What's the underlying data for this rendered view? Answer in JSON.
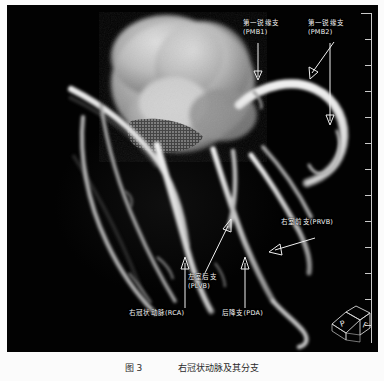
{
  "figure": {
    "modality": "CT coronary volume rendering",
    "caption": "图 3　　　　右冠状动脉及其分支",
    "background_color": "#020202",
    "page_color": "#fbfbfb",
    "annotation_color": "#f4f4f4"
  },
  "annotations": [
    {
      "id": "pmb1",
      "line1": "第一锐缘支",
      "line2": "(PMB1)",
      "x": 243,
      "y": 19,
      "arrow": {
        "x1": 258,
        "y1": 38,
        "x2": 258,
        "y2": 73,
        "head": "down"
      }
    },
    {
      "id": "pmb2",
      "line1": "第一锐缘支",
      "line2": "(PMB2)",
      "x": 308,
      "y": 19,
      "arrow": {
        "x1": 322,
        "y1": 38,
        "x2": 305,
        "y2": 72,
        "head": "down-left"
      }
    },
    {
      "id": "pmb2-long",
      "line1": "",
      "line2": "",
      "x": 0,
      "y": 0,
      "arrow": {
        "x1": 330,
        "y1": 40,
        "x2": 324,
        "y2": 120,
        "head": "down"
      }
    },
    {
      "id": "prvb",
      "line1": "右室前支(PRVB)",
      "line2": "",
      "x": 281,
      "y": 218,
      "arrow": {
        "x1": 312,
        "y1": 233,
        "x2": 265,
        "y2": 248,
        "head": "left"
      }
    },
    {
      "id": "plvb",
      "line1": "左室后支",
      "line2": "(PLVB)",
      "x": 188,
      "y": 273,
      "arrow": {
        "x1": 196,
        "y1": 270,
        "x2": 224,
        "y2": 218,
        "head": "up-right"
      }
    },
    {
      "id": "rca",
      "line1": "右冠状动脉(RCA)",
      "line2": "",
      "x": 129,
      "y": 309,
      "arrow": {
        "x1": 183,
        "y1": 305,
        "x2": 183,
        "y2": 256,
        "head": "up"
      }
    },
    {
      "id": "pda",
      "line1": "后降支(PDA)",
      "line2": "",
      "x": 222,
      "y": 309,
      "arrow": {
        "x1": 242,
        "y1": 305,
        "x2": 242,
        "y2": 256,
        "head": "up"
      }
    }
  ],
  "ruler": {
    "tick_count": 13,
    "color": "#c9c9c9",
    "orientation": "vertical-right"
  },
  "orientation_cube": {
    "face_labels": [
      "P",
      "F"
    ],
    "color": "#d6d6d6"
  }
}
